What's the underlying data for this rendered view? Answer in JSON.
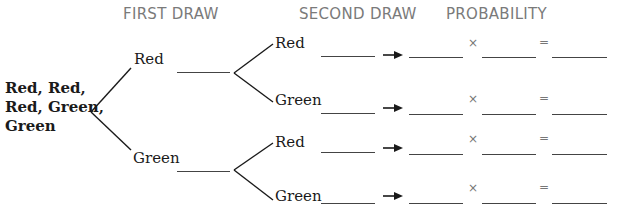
{
  "headers": {
    "first_draw": "FIRST DRAW",
    "second_draw": "SECOND DRAW",
    "probability": "PROBABILITY"
  },
  "root": {
    "line1": "Red, Red,",
    "line2": "Red, Green,",
    "line3": "Green"
  },
  "first_draw": [
    {
      "label": "Red",
      "blank": ""
    },
    {
      "label": "Green",
      "blank": ""
    }
  ],
  "second_draw": [
    {
      "label": "Red",
      "blank": "",
      "prob_first": "",
      "prob_second": "",
      "result": ""
    },
    {
      "label": "Green",
      "blank": "",
      "prob_first": "",
      "prob_second": "",
      "result": ""
    },
    {
      "label": "Red",
      "blank": "",
      "prob_first": "",
      "prob_second": "",
      "result": ""
    },
    {
      "label": "Green",
      "blank": "",
      "prob_first": "",
      "prob_second": "",
      "result": ""
    }
  ],
  "operators": {
    "multiply": "×",
    "equals": "=",
    "arrow": "arrow-right-icon"
  },
  "colors": {
    "header_text": "#7a7a7a",
    "line": "#1a1a1a",
    "blank_line": "#444444"
  }
}
